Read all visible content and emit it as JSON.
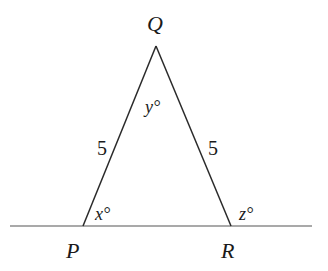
{
  "diagram": {
    "type": "isosceles-triangle-on-line",
    "colors": {
      "stroke": "#2a2a2a",
      "baseline": "#555555",
      "text": "#1a1a1a"
    },
    "vertices": {
      "Q": {
        "label": "Q",
        "x": 156,
        "y": 46
      },
      "P": {
        "label": "P",
        "x": 83,
        "y": 226
      },
      "R": {
        "label": "R",
        "x": 231,
        "y": 226
      }
    },
    "baseline": {
      "x1": 10,
      "x2": 312,
      "y": 226
    },
    "side_labels": {
      "PQ": "5",
      "QR": "5"
    },
    "angle_labels": {
      "P": "x°",
      "Q": "y°",
      "R": "z°"
    }
  }
}
